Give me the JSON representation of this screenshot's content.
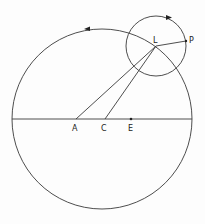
{
  "diagram": {
    "type": "epicycle-geometry",
    "colors": {
      "stroke": "#3a3a3a",
      "background": "#fdfdfd"
    },
    "deferent": {
      "center": [
        102,
        119
      ],
      "radius": 90,
      "direction_arrow": "counterclockwise"
    },
    "epicycle": {
      "center_label": "L",
      "center": [
        156,
        46
      ],
      "radius": 30,
      "direction_arrow": "clockwise"
    },
    "points": {
      "A": {
        "label": "A",
        "pos": [
          76,
          119
        ]
      },
      "C": {
        "label": "C",
        "pos": [
          105,
          119
        ]
      },
      "E": {
        "label": "E",
        "pos": [
          131,
          119
        ]
      },
      "L": {
        "label": "L",
        "pos": [
          156,
          46
        ]
      },
      "P": {
        "label": "P",
        "pos": [
          186,
          41
        ]
      }
    },
    "segments": [
      {
        "from": "A",
        "to": "L"
      },
      {
        "from": "C",
        "to": "L"
      },
      {
        "from": "L",
        "to": "P"
      }
    ],
    "diameter": {
      "from": [
        12,
        119
      ],
      "to": [
        192,
        119
      ]
    }
  }
}
